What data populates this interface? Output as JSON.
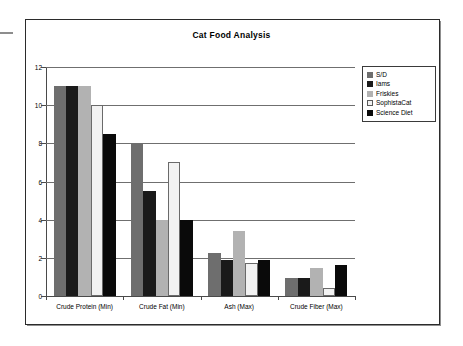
{
  "chart_data": {
    "type": "bar",
    "title": "Cat Food Analysis",
    "xlabel": "",
    "ylabel": "",
    "ylim": [
      0,
      12
    ],
    "yticks": [
      0,
      2,
      4,
      6,
      8,
      10,
      12
    ],
    "grid": true,
    "legend_position": "top-right",
    "categories": [
      "Crude Protein (Min)",
      "Crude Fat (Min)",
      "Ash (Max)",
      "Crude Fiber (Max)"
    ],
    "series": [
      {
        "name": "S/D",
        "color": "#6e6e6e",
        "values": [
          11,
          8,
          2.25,
          0.95
        ]
      },
      {
        "name": "Iams",
        "color": "#1a1a1a",
        "values": [
          11,
          5.5,
          1.9,
          0.95
        ]
      },
      {
        "name": "Friskies",
        "color": "#b2b2b2",
        "values": [
          11,
          4,
          3.4,
          1.45
        ]
      },
      {
        "name": "SophistaCat",
        "color": "#f2f2f2",
        "values": [
          10,
          7,
          1.75,
          0.4
        ]
      },
      {
        "name": "Science Diet",
        "color": "#0a0a0a",
        "values": [
          8.5,
          4,
          1.9,
          1.65
        ]
      }
    ]
  },
  "legend": {
    "items": [
      {
        "label": "S/D"
      },
      {
        "label": "Iams"
      },
      {
        "label": "Friskies"
      },
      {
        "label": "SophistaCat"
      },
      {
        "label": "Science Diet"
      }
    ]
  }
}
